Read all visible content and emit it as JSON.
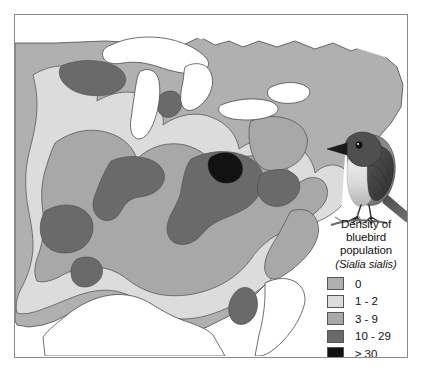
{
  "figure": {
    "type": "thematic-map",
    "subject": "Density of bluebird population (Sialia sialis)",
    "region": "Eastern United States"
  },
  "legend": {
    "title_lines": [
      "Density of",
      "bluebird",
      "population"
    ],
    "scientific_name": "(Sialia sialis)",
    "entries": [
      {
        "label": "0",
        "color": "#b0b0b0",
        "swatch_name": "legend-swatch-0"
      },
      {
        "label": "1 - 2",
        "color": "#dcdcdc",
        "swatch_name": "legend-swatch-1-2"
      },
      {
        "label": "3 - 9",
        "color": "#a8a8a8",
        "swatch_name": "legend-swatch-3-9"
      },
      {
        "label": "10 - 29",
        "color": "#6a6a6a",
        "swatch_name": "legend-swatch-10-29"
      },
      {
        "label": "≥ 30",
        "color": "#121212",
        "swatch_name": "legend-swatch-30-plus"
      }
    ]
  },
  "map": {
    "water_color": "#ffffff",
    "outline_color": "#4a4a4a",
    "frame_color": "#8a8a8a",
    "background_color": "#ffffff",
    "class_colors": [
      "#b0b0b0",
      "#dcdcdc",
      "#a8a8a8",
      "#6a6a6a",
      "#121212"
    ],
    "water_features": [
      "Great Lakes",
      "Gulf of Mexico",
      "Atlantic Ocean"
    ]
  },
  "illustration": {
    "name": "eastern-bluebird",
    "description": "Grayscale drawing of a bluebird perched on a branch"
  }
}
